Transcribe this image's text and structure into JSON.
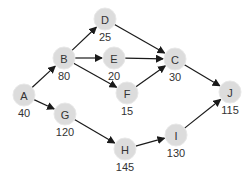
{
  "diagram": {
    "type": "directed-graph",
    "colors": {
      "node_fill": "#dcdcdc",
      "edge": "#1a1a1a",
      "text": "#333333"
    },
    "nodes": [
      {
        "id": "A",
        "label": "A",
        "value": "40",
        "x": 24,
        "y": 95
      },
      {
        "id": "B",
        "label": "B",
        "value": "80",
        "x": 64,
        "y": 58
      },
      {
        "id": "D",
        "label": "D",
        "value": "25",
        "x": 105,
        "y": 19
      },
      {
        "id": "E",
        "label": "E",
        "value": "20",
        "x": 114,
        "y": 58
      },
      {
        "id": "F",
        "label": "F",
        "value": "15",
        "x": 127,
        "y": 93
      },
      {
        "id": "C",
        "label": "C",
        "value": "30",
        "x": 175,
        "y": 59
      },
      {
        "id": "G",
        "label": "G",
        "value": "120",
        "x": 65,
        "y": 114
      },
      {
        "id": "H",
        "label": "H",
        "value": "145",
        "x": 125,
        "y": 149
      },
      {
        "id": "I",
        "label": "I",
        "value": "130",
        "x": 176,
        "y": 135
      },
      {
        "id": "J",
        "label": "J",
        "value": "115",
        "x": 230,
        "y": 92
      }
    ],
    "edges": [
      {
        "from": "A",
        "to": "B"
      },
      {
        "from": "A",
        "to": "G"
      },
      {
        "from": "B",
        "to": "D"
      },
      {
        "from": "B",
        "to": "E"
      },
      {
        "from": "B",
        "to": "F"
      },
      {
        "from": "D",
        "to": "C"
      },
      {
        "from": "E",
        "to": "C"
      },
      {
        "from": "F",
        "to": "C"
      },
      {
        "from": "C",
        "to": "J"
      },
      {
        "from": "G",
        "to": "H"
      },
      {
        "from": "H",
        "to": "I"
      },
      {
        "from": "I",
        "to": "J"
      }
    ]
  }
}
